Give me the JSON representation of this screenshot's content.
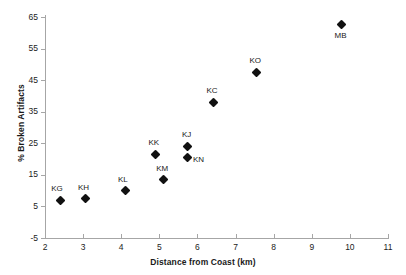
{
  "chart_data": {
    "type": "scatter",
    "title": "",
    "xlabel": "Distance from Coast (km)",
    "ylabel": "% Broken Artifacts",
    "xlim": [
      2,
      11
    ],
    "ylim": [
      -5,
      65
    ],
    "xticks": [
      2,
      3,
      4,
      5,
      6,
      7,
      8,
      9,
      10,
      11
    ],
    "yticks": [
      -5,
      5,
      15,
      25,
      35,
      45,
      55,
      65
    ],
    "grid": false,
    "legend": "none",
    "marker": "filled-diamond",
    "marker_color": "#111111",
    "axis_color": "#a6a6a6",
    "points": [
      {
        "label": "KG",
        "x": 2.4,
        "y": 7.0,
        "label_dx": -9,
        "label_dy": -16
      },
      {
        "label": "KH",
        "x": 3.05,
        "y": 7.5,
        "label_dx": -7,
        "label_dy": -16
      },
      {
        "label": "KL",
        "x": 4.1,
        "y": 10.0,
        "label_dx": -7,
        "label_dy": -16
      },
      {
        "label": "KM",
        "x": 5.1,
        "y": 13.5,
        "label_dx": -7,
        "label_dy": -16
      },
      {
        "label": "KK",
        "x": 4.9,
        "y": 21.5,
        "label_dx": -7,
        "label_dy": -16
      },
      {
        "label": "KJ",
        "x": 5.75,
        "y": 24.0,
        "label_dx": -6,
        "label_dy": -16
      },
      {
        "label": "KN",
        "x": 5.75,
        "y": 20.5,
        "label_dx": 5,
        "label_dy": -2
      },
      {
        "label": "KC",
        "x": 6.42,
        "y": 38.0,
        "label_dx": -7,
        "label_dy": -16
      },
      {
        "label": "KO",
        "x": 7.55,
        "y": 47.5,
        "label_dx": -7,
        "label_dy": -16
      },
      {
        "label": "MB",
        "x": 9.78,
        "y": 62.5,
        "label_dx": -7,
        "label_dy": 6
      }
    ]
  }
}
